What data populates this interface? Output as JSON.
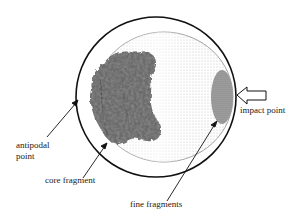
{
  "diagram": {
    "type": "impact fragmentation schematic",
    "labels": {
      "impact_point": "impact point",
      "antipodal_point_line1": "antipodal",
      "antipodal_point_line2": "point",
      "core_fragment": "core fragment",
      "fine_fragments": "fine fragments"
    },
    "colors": {
      "outline": "#111111",
      "inner_outline": "#8a8a8a",
      "stipple": "#cfcfcf",
      "core_fragment": "#6b6b6b",
      "fine_fragments": "#8c8c8c"
    }
  }
}
